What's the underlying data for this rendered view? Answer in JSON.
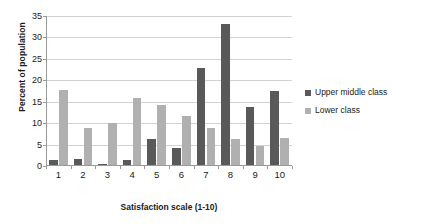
{
  "chart_data": {
    "type": "bar",
    "title": "",
    "xlabel": "Satisfaction scale (1-10)",
    "ylabel": "Percent of population",
    "categories": [
      "1",
      "2",
      "3",
      "4",
      "5",
      "6",
      "7",
      "8",
      "9",
      "10"
    ],
    "series": [
      {
        "name": "Upper middle class",
        "color": "#595959",
        "values": [
          1.5,
          1.6,
          0.4,
          1.4,
          6.3,
          4.3,
          22.8,
          33.2,
          13.7,
          17.5
        ]
      },
      {
        "name": "Lower class",
        "color": "#b0b0b0",
        "values": [
          17.8,
          8.8,
          10.1,
          15.9,
          14.2,
          11.6,
          8.8,
          6.3,
          4.7,
          6.5
        ]
      }
    ],
    "ylim": [
      0,
      35
    ],
    "y_ticks": [
      0,
      5,
      10,
      15,
      20,
      25,
      30,
      35
    ],
    "y_tick_labels": [
      "0",
      "5",
      "10",
      "15",
      "20",
      "25",
      "30",
      "35"
    ],
    "grid": "horizontal",
    "legend_position": "right"
  }
}
